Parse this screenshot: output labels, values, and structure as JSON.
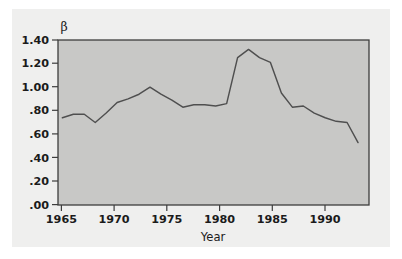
{
  "figure": {
    "background_color": "#ffffff",
    "panel_color": "#efefee",
    "plot_area_color": "#c8c8c6",
    "frame_color": "#3d3d3d",
    "line_color": "#4f4f4f",
    "text_color": "#1b1b1b"
  },
  "chart_data": {
    "type": "line",
    "title": "",
    "subtitle": "",
    "xlabel": "Year",
    "ylabel": "β",
    "xlim": [
      1964.6,
      1993.0
    ],
    "ylim": [
      0.0,
      1.4
    ],
    "grid": false,
    "legend": null,
    "xticks": [
      1965,
      1970,
      1975,
      1980,
      1985,
      1990
    ],
    "xticklabels": [
      "1965",
      "1970",
      "1975",
      "1980",
      "1985",
      "1990"
    ],
    "yticks": [
      0.0,
      0.2,
      0.4,
      0.6,
      0.8,
      1.0,
      1.2,
      1.4
    ],
    "yticklabels": [
      ".00",
      ".20",
      ".40",
      ".60",
      ".80",
      "1.00",
      "1.20",
      "1.40"
    ],
    "x": [
      1965,
      1966,
      1967,
      1968,
      1969,
      1970,
      1971,
      1972,
      1973,
      1974,
      1975,
      1976,
      1977,
      1978,
      1979,
      1980,
      1981,
      1982,
      1983,
      1984,
      1985,
      1986,
      1987,
      1988,
      1989,
      1990,
      1991,
      1992
    ],
    "series": [
      {
        "name": "β",
        "values": [
          0.74,
          0.77,
          0.77,
          0.7,
          0.78,
          0.87,
          0.9,
          0.94,
          1.0,
          0.94,
          0.89,
          0.83,
          0.85,
          0.85,
          0.84,
          0.86,
          1.25,
          1.32,
          1.25,
          1.21,
          0.95,
          0.83,
          0.84,
          0.78,
          0.74,
          0.71,
          0.7,
          0.53
        ]
      }
    ],
    "annotations": []
  },
  "axis_labels": {
    "y_axis_symbol": "β",
    "x_axis_name": "Year"
  }
}
